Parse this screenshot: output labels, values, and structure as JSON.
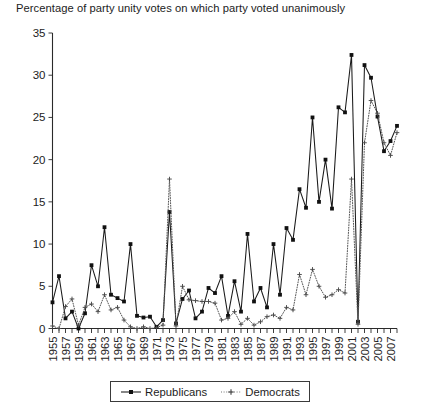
{
  "chart_data": {
    "type": "line",
    "title": "Percentage of party unity votes on which party voted unanimously",
    "xlabel": "",
    "ylabel": "",
    "ylim": [
      0,
      35
    ],
    "ytick_values": [
      0,
      5,
      10,
      15,
      20,
      25,
      30,
      35
    ],
    "ytick_labels": [
      "0",
      "5",
      "10",
      "15",
      "20",
      "25",
      "30",
      "35"
    ],
    "xlim": [
      1955,
      2008
    ],
    "grid": false,
    "legend_position": "bottom-center",
    "xtick_labels": [
      "1955",
      "1957",
      "1959",
      "1961",
      "1963",
      "1965",
      "1967",
      "1969",
      "1971",
      "1973",
      "1975",
      "1977",
      "1979",
      "1981",
      "1983",
      "1985",
      "1987",
      "1989",
      "1991",
      "1993",
      "1995",
      "1997",
      "1999",
      "2001",
      "2003",
      "2005",
      "2007"
    ],
    "x": [
      1955,
      1956,
      1957,
      1958,
      1959,
      1960,
      1961,
      1962,
      1963,
      1964,
      1965,
      1966,
      1967,
      1968,
      1969,
      1970,
      1971,
      1972,
      1973,
      1974,
      1975,
      1976,
      1977,
      1978,
      1979,
      1980,
      1981,
      1982,
      1983,
      1984,
      1985,
      1986,
      1987,
      1988,
      1989,
      1990,
      1991,
      1992,
      1993,
      1994,
      1995,
      1996,
      1997,
      1998,
      1999,
      2000,
      2001,
      2002,
      2003,
      2004,
      2005,
      2006,
      2007,
      2008
    ],
    "series": [
      {
        "name": "Republicans",
        "marker": "filled-square",
        "linestyle": "solid",
        "color": "#1a1a1a",
        "values": [
          3.1,
          6.2,
          1.2,
          2.0,
          0.0,
          1.8,
          7.5,
          5.0,
          12.0,
          4.0,
          3.6,
          3.2,
          10.0,
          1.5,
          1.3,
          1.4,
          0.2,
          1.0,
          13.8,
          0.6,
          3.5,
          4.5,
          1.2,
          2.0,
          4.8,
          4.2,
          6.2,
          1.5,
          5.6,
          2.0,
          11.2,
          3.2,
          4.8,
          2.5,
          10.0,
          4.0,
          11.9,
          10.5,
          16.5,
          14.3,
          25.0,
          15.0,
          20.0,
          14.2,
          26.2,
          25.6,
          32.4,
          0.8,
          31.2,
          29.7,
          25.1,
          21.0,
          22.2,
          24.0
        ]
      },
      {
        "name": "Democrats",
        "marker": "plus",
        "linestyle": "dotted",
        "color": "#4a4a4a",
        "values": [
          0.3,
          0.0,
          2.6,
          3.5,
          0.4,
          2.5,
          2.9,
          2.0,
          4.0,
          2.2,
          2.5,
          1.0,
          0.2,
          0.0,
          0.2,
          0.0,
          0.1,
          0.4,
          17.7,
          0.3,
          5.0,
          3.4,
          3.3,
          3.2,
          3.2,
          3.0,
          1.0,
          1.2,
          2.0,
          0.5,
          1.2,
          0.4,
          0.8,
          1.4,
          1.6,
          1.2,
          2.5,
          2.2,
          6.4,
          4.0,
          7.0,
          5.0,
          3.7,
          4.0,
          4.6,
          4.2,
          17.7,
          0.5,
          22.0,
          27.0,
          25.5,
          22.0,
          20.5,
          23.2
        ]
      }
    ]
  },
  "legend": {
    "entries": [
      {
        "label": "Republicans"
      },
      {
        "label": "Democrats"
      }
    ]
  }
}
